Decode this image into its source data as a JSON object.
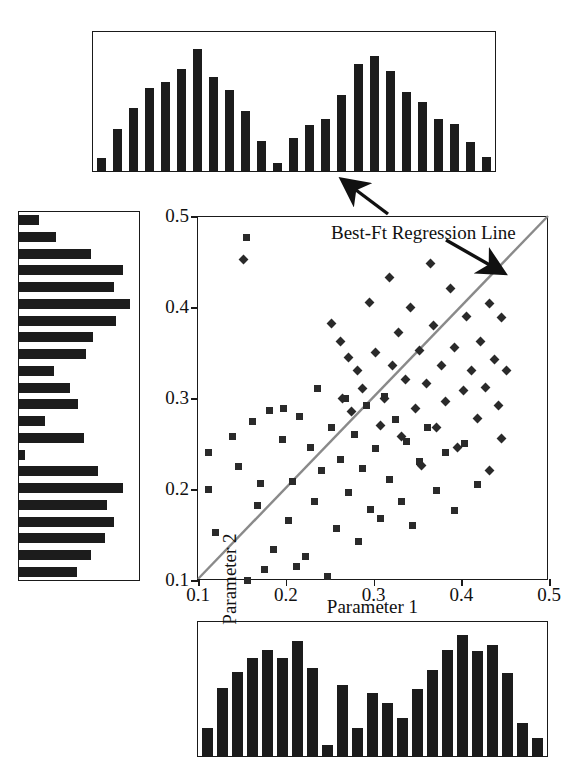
{
  "annotation": {
    "regression_label": "Best-Ft Regression Line"
  },
  "axes": {
    "x_title": "Parameter 1",
    "y_title": "Parameter 2",
    "x_ticks": [
      "0.1",
      "0.2",
      "0.3",
      "0.4",
      "0.5"
    ],
    "y_ticks": [
      "0.1",
      "0.2",
      "0.3",
      "0.4",
      "0.5"
    ]
  },
  "colors": {
    "marker": "#2a2a2a",
    "bar": "#1c1c1c",
    "frame": "#1a1a1a",
    "regression_line": "#8a8a8a",
    "background": "#ffffff"
  },
  "chart_data": [
    {
      "type": "scatter",
      "title": "",
      "xlabel": "Parameter 1",
      "ylabel": "Parameter 2",
      "xlim": [
        0.1,
        0.5
      ],
      "ylim": [
        0.1,
        0.5
      ],
      "grid": false,
      "legend": "none",
      "annotations": [
        {
          "text": "Best-Ft Regression Line",
          "x": 0.345,
          "y": 0.455,
          "arrows": [
            {
              "to_x": 0.33,
              "to_y": 0.565,
              "target": "top-histogram"
            },
            {
              "to_x": 0.455,
              "to_y": 0.4,
              "target": "regression-line"
            }
          ]
        }
      ],
      "regression_line": {
        "x0": 0.1,
        "y0": 0.1,
        "x1": 0.5,
        "y1": 0.5
      },
      "series": [
        {
          "name": "square-markers",
          "marker": "square",
          "points": [
            [
              0.155,
              0.476
            ],
            [
              0.112,
              0.24
            ],
            [
              0.112,
              0.2
            ],
            [
              0.12,
              0.152
            ],
            [
              0.139,
              0.258
            ],
            [
              0.146,
              0.225
            ],
            [
              0.156,
              0.1
            ],
            [
              0.162,
              0.274
            ],
            [
              0.168,
              0.182
            ],
            [
              0.171,
              0.206
            ],
            [
              0.176,
              0.112
            ],
            [
              0.182,
              0.286
            ],
            [
              0.186,
              0.134
            ],
            [
              0.196,
              0.254
            ],
            [
              0.198,
              0.288
            ],
            [
              0.203,
              0.165
            ],
            [
              0.208,
              0.208
            ],
            [
              0.212,
              0.115
            ],
            [
              0.216,
              0.28
            ],
            [
              0.222,
              0.126
            ],
            [
              0.228,
              0.246
            ],
            [
              0.233,
              0.186
            ],
            [
              0.236,
              0.31
            ],
            [
              0.241,
              0.22
            ],
            [
              0.248,
              0.104
            ],
            [
              0.252,
              0.268
            ],
            [
              0.258,
              0.157
            ],
            [
              0.262,
              0.232
            ],
            [
              0.268,
              0.3
            ],
            [
              0.272,
              0.196
            ],
            [
              0.278,
              0.26
            ],
            [
              0.283,
              0.142
            ],
            [
              0.288,
              0.222
            ],
            [
              0.292,
              0.292
            ],
            [
              0.297,
              0.178
            ],
            [
              0.302,
              0.245
            ],
            [
              0.308,
              0.168
            ],
            [
              0.312,
              0.302
            ],
            [
              0.318,
              0.21
            ],
            [
              0.325,
              0.276
            ],
            [
              0.332,
              0.186
            ],
            [
              0.338,
              0.252
            ],
            [
              0.345,
              0.16
            ],
            [
              0.352,
              0.23
            ],
            [
              0.362,
              0.268
            ],
            [
              0.372,
              0.198
            ],
            [
              0.382,
              0.24
            ],
            [
              0.392,
              0.176
            ],
            [
              0.404,
              0.25
            ],
            [
              0.418,
              0.205
            ]
          ]
        },
        {
          "name": "diamond-markers",
          "marker": "diamond",
          "points": [
            [
              0.152,
              0.452
            ],
            [
              0.252,
              0.382
            ],
            [
              0.262,
              0.362
            ],
            [
              0.272,
              0.344
            ],
            [
              0.282,
              0.33
            ],
            [
              0.265,
              0.3
            ],
            [
              0.275,
              0.285
            ],
            [
              0.288,
              0.31
            ],
            [
              0.295,
              0.405
            ],
            [
              0.302,
              0.35
            ],
            [
              0.308,
              0.27
            ],
            [
              0.312,
              0.3
            ],
            [
              0.318,
              0.432
            ],
            [
              0.322,
              0.336
            ],
            [
              0.328,
              0.372
            ],
            [
              0.332,
              0.258
            ],
            [
              0.336,
              0.32
            ],
            [
              0.342,
              0.4
            ],
            [
              0.348,
              0.288
            ],
            [
              0.352,
              0.352
            ],
            [
              0.355,
              0.226
            ],
            [
              0.36,
              0.316
            ],
            [
              0.365,
              0.448
            ],
            [
              0.368,
              0.38
            ],
            [
              0.372,
              0.268
            ],
            [
              0.378,
              0.336
            ],
            [
              0.382,
              0.296
            ],
            [
              0.388,
              0.42
            ],
            [
              0.392,
              0.356
            ],
            [
              0.396,
              0.246
            ],
            [
              0.402,
              0.308
            ],
            [
              0.406,
              0.39
            ],
            [
              0.412,
              0.33
            ],
            [
              0.418,
              0.278
            ],
            [
              0.422,
              0.362
            ],
            [
              0.428,
              0.312
            ],
            [
              0.432,
              0.404
            ],
            [
              0.438,
              0.342
            ],
            [
              0.442,
              0.292
            ],
            [
              0.446,
              0.388
            ],
            [
              0.452,
              0.33
            ],
            [
              0.446,
              0.256
            ],
            [
              0.432,
              0.22
            ]
          ]
        }
      ]
    },
    {
      "type": "bar",
      "name": "top-marginal-histogram",
      "orientation": "vertical",
      "title": "",
      "xlabel": "",
      "ylabel": "",
      "ylim": [
        0,
        100
      ],
      "grid": false,
      "categories": [
        "1",
        "2",
        "3",
        "4",
        "5",
        "6",
        "7",
        "8",
        "9",
        "10",
        "11",
        "12",
        "13",
        "14",
        "15",
        "16",
        "17",
        "18",
        "19",
        "20",
        "21",
        "22",
        "23",
        "24",
        "25"
      ],
      "values": [
        10,
        32,
        48,
        63,
        68,
        78,
        93,
        72,
        62,
        46,
        23,
        6,
        25,
        35,
        40,
        58,
        82,
        88,
        76,
        60,
        53,
        40,
        36,
        22,
        11
      ]
    },
    {
      "type": "bar",
      "name": "bottom-marginal-histogram",
      "orientation": "vertical",
      "title": "",
      "xlabel": "",
      "ylabel": "",
      "ylim": [
        0,
        100
      ],
      "grid": false,
      "categories": [
        "1",
        "2",
        "3",
        "4",
        "5",
        "6",
        "7",
        "8",
        "9",
        "10",
        "11",
        "12",
        "13",
        "14",
        "15",
        "16",
        "17",
        "18",
        "19",
        "20",
        "21",
        "22",
        "23"
      ],
      "values": [
        22,
        54,
        67,
        78,
        84,
        78,
        91,
        70,
        9,
        56,
        22,
        50,
        42,
        30,
        53,
        68,
        84,
        96,
        83,
        88,
        66,
        26,
        14
      ]
    },
    {
      "type": "bar",
      "name": "left-marginal-histogram",
      "orientation": "horizontal",
      "title": "",
      "xlabel": "",
      "ylabel": "",
      "xlim": [
        0,
        100
      ],
      "grid": false,
      "categories": [
        "1",
        "2",
        "3",
        "4",
        "5",
        "6",
        "7",
        "8",
        "9",
        "10",
        "11",
        "12",
        "13",
        "14",
        "15",
        "16",
        "17",
        "18",
        "19",
        "20",
        "21",
        "22"
      ],
      "values": [
        17,
        32,
        62,
        90,
        82,
        96,
        84,
        64,
        58,
        30,
        44,
        51,
        22,
        56,
        5,
        68,
        90,
        76,
        82,
        74,
        62,
        50
      ]
    }
  ],
  "histograms": {
    "top": [
      10,
      32,
      48,
      63,
      68,
      78,
      93,
      72,
      62,
      46,
      23,
      6,
      25,
      35,
      40,
      58,
      82,
      88,
      76,
      60,
      53,
      40,
      36,
      22,
      11
    ],
    "bottom": [
      22,
      54,
      67,
      78,
      84,
      78,
      91,
      70,
      9,
      56,
      22,
      50,
      42,
      30,
      53,
      68,
      84,
      96,
      83,
      88,
      66,
      26,
      14
    ],
    "left": [
      17,
      32,
      62,
      90,
      82,
      96,
      84,
      64,
      58,
      30,
      44,
      51,
      22,
      56,
      5,
      68,
      90,
      76,
      82,
      74,
      62,
      50
    ]
  }
}
